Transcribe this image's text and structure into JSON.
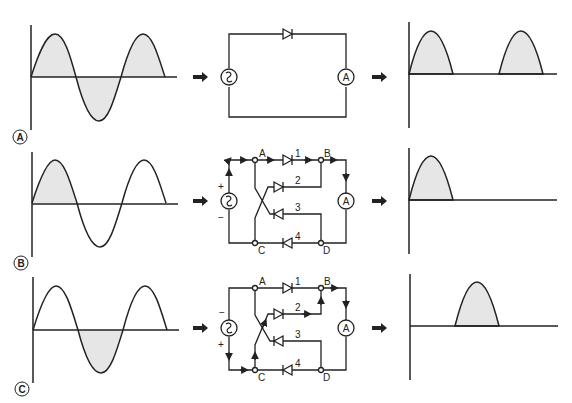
{
  "diagram": {
    "colors": {
      "stroke": "#222222",
      "fill": "#e6e6e6",
      "background": "#ffffff"
    },
    "rows": [
      {
        "id": "A",
        "label": "A",
        "input_wave": "sine, both half-cycles shaded",
        "circuit": "single diode series circuit with AC source and ammeter",
        "circuit_symbols": {
          "source": "~",
          "ammeter": "A"
        },
        "output_wave": "positive half-cycles only"
      },
      {
        "id": "B",
        "label": "B",
        "input_wave": "sine, first positive half-cycle shaded",
        "circuit": "diode bridge, positive polarity",
        "polarity": {
          "top": "+",
          "bottom": "−"
        },
        "nodes": [
          "A",
          "B",
          "C",
          "D"
        ],
        "diodes": [
          "1",
          "2",
          "3",
          "4"
        ],
        "circuit_symbols": {
          "source": "~",
          "ammeter": "A"
        },
        "output_wave": "single positive pulse at start"
      },
      {
        "id": "C",
        "label": "C",
        "input_wave": "sine, negative half-cycle shaded",
        "circuit": "diode bridge, reversed polarity",
        "polarity": {
          "top": "−",
          "bottom": "+"
        },
        "nodes": [
          "A",
          "B",
          "C",
          "D"
        ],
        "diodes": [
          "1",
          "2",
          "3",
          "4"
        ],
        "circuit_symbols": {
          "source": "~",
          "ammeter": "A"
        },
        "output_wave": "single positive pulse in second half-cycle"
      }
    ]
  }
}
